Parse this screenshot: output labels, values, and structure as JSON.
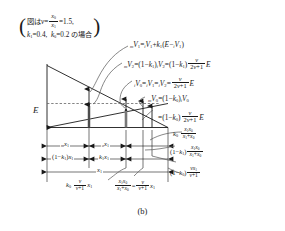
{
  "figure": {
    "caption": "(b)",
    "axis_label_E": "E",
    "note": {
      "line1_prefix": "図は",
      "line1_nu": "ν",
      "line1_eq1": "=",
      "line1_frac_num": "x",
      "line1_frac_num_sub": "0",
      "line1_frac_den": "x",
      "line1_frac_den_sub": "1",
      "line1_eq2": "=",
      "line1_value": "1.5,",
      "line2_k1": "k",
      "line2_k1_sub": "1",
      "line2_k1_val": "=0.4,",
      "line2_k0": "k",
      "line2_k0_sub": "0",
      "line2_k0_val": "=0.2",
      "line2_suffix": "の場合"
    },
    "equations": [
      {
        "id": "eq-mV1",
        "text": "mV1 = iV1 + k1(E - iV1)"
      },
      {
        "id": "eq-mV2",
        "text": "mV2 = (1-k1) iV2 = (1-k1) nu/(2nu+1) E"
      },
      {
        "id": "eq-iV0",
        "text": "iV0 = iV1 = iV2 = nu/(2nu+1) E"
      },
      {
        "id": "eq-mV0",
        "text": "mV0 = (1-k0) iV0"
      },
      {
        "id": "eq-mV0-cont",
        "text": "= (1-k0) nu/(2nu+1) E"
      }
    ],
    "dimension_labels": {
      "row1_left": "m x1",
      "row1_right": "o x1",
      "row2_left": "(1-k1) x1",
      "row2_right": "k1 x1",
      "row3": "x1",
      "right1": "k0 x1x0/(x1+x0)",
      "right2": "(1-k1) x1x0/(x1+x0)",
      "right3": "(1-k0) nu x1/(nu+1)",
      "bottom1": "k0 nu/(nu+1) x1",
      "bottom2": "x1x0/(x1+x0) = nu/(nu+1) x1"
    },
    "symbols": {
      "nu": "ν",
      "E": "E",
      "V": "V",
      "k": "k",
      "x": "x",
      "minus": "−",
      "equals": "="
    },
    "colors": {
      "stroke": "#1a1a1a",
      "dashed": "#555555",
      "background": "#ffffff"
    }
  }
}
